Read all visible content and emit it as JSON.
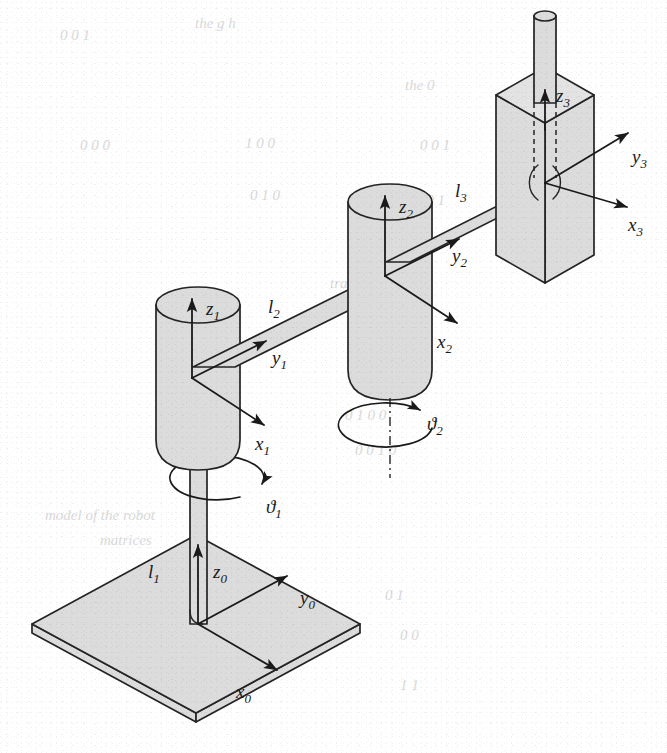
{
  "figure": {
    "background_color": "#ffffff",
    "part_fill_color": "#dcdcdc",
    "line_color": "#242424",
    "ghost_text_color": "#d9d9d9"
  },
  "labels": {
    "frame0": {
      "x": {
        "base": "x",
        "sub": "0"
      },
      "y": {
        "base": "y",
        "sub": "0"
      },
      "z": {
        "base": "z",
        "sub": "0"
      }
    },
    "frame1": {
      "x": {
        "base": "x",
        "sub": "1"
      },
      "y": {
        "base": "y",
        "sub": "1"
      },
      "z": {
        "base": "z",
        "sub": "1"
      }
    },
    "frame2": {
      "x": {
        "base": "x",
        "sub": "2"
      },
      "y": {
        "base": "y",
        "sub": "2"
      },
      "z": {
        "base": "z",
        "sub": "2"
      }
    },
    "frame3": {
      "x": {
        "base": "x",
        "sub": "3"
      },
      "y": {
        "base": "y",
        "sub": "3"
      },
      "z": {
        "base": "z",
        "sub": "3"
      }
    },
    "links": {
      "l1": {
        "base": "l",
        "sub": "1"
      },
      "l2": {
        "base": "l",
        "sub": "2"
      },
      "l3": {
        "base": "l",
        "sub": "3"
      }
    },
    "joints": {
      "theta1": {
        "base": "ϑ",
        "sub": "1"
      },
      "theta2": {
        "base": "ϑ",
        "sub": "2"
      }
    }
  },
  "ghost_text": {
    "note": "faint show-through text from the reverse page, largely illegible",
    "lines": [
      {
        "text": "0  0  1",
        "x": 60,
        "y": 40
      },
      {
        "text": "the  g  h",
        "x": 195,
        "y": 28
      },
      {
        "text": "the   0",
        "x": 405,
        "y": 90
      },
      {
        "text": "0  0  0",
        "x": 80,
        "y": 150
      },
      {
        "text": "1  0  0",
        "x": 245,
        "y": 148
      },
      {
        "text": "0  0  1",
        "x": 420,
        "y": 150
      },
      {
        "text": "0  1  0",
        "x": 250,
        "y": 200
      },
      {
        "text": "0  0  1",
        "x": 415,
        "y": 205
      },
      {
        "text": "translat",
        "x": 330,
        "y": 288
      },
      {
        "text": "0  0  0  1",
        "x": 360,
        "y": 350
      },
      {
        "text": "0  0  0",
        "x": 385,
        "y": 385
      },
      {
        "text": "0  1  0  0",
        "x": 345,
        "y": 420
      },
      {
        "text": "0  0  1  0",
        "x": 355,
        "y": 455
      },
      {
        "text": "model of the  robot",
        "x": 45,
        "y": 520
      },
      {
        "text": "matrices",
        "x": 100,
        "y": 545
      },
      {
        "text": "0  1",
        "x": 385,
        "y": 600
      },
      {
        "text": "0  0",
        "x": 400,
        "y": 640
      },
      {
        "text": "1  1",
        "x": 400,
        "y": 690
      }
    ]
  }
}
